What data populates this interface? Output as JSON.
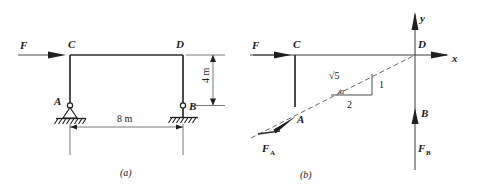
{
  "figure": {
    "title_a": "(a)",
    "title_b": "(b)",
    "background_color": "#ffffff",
    "line_color": "#2b2b2b"
  },
  "diagram_a": {
    "caption": "(a)",
    "load_label": "F",
    "joint_c_label": "C",
    "joint_d_label": "D",
    "support_a_label": "A",
    "support_b_label": "B",
    "dim_vertical": "4 m",
    "dim_horizontal": "8 m",
    "support_a_type": "pin-support",
    "support_b_type": "roller-support"
  },
  "diagram_b": {
    "caption": "(b)",
    "load_label": "F",
    "joint_c_label": "C",
    "joint_d_label": "D",
    "point_a_label": "A",
    "point_b_label": "B",
    "reaction_a_label": "F",
    "reaction_a_sub": "A",
    "reaction_b_label": "F",
    "reaction_b_sub": "B",
    "axis_x_label": "x",
    "axis_y_label": "y",
    "angle_label": "α",
    "triangle_hyp_label": "√5",
    "triangle_vert_label": "1",
    "triangle_base_label": "2"
  }
}
